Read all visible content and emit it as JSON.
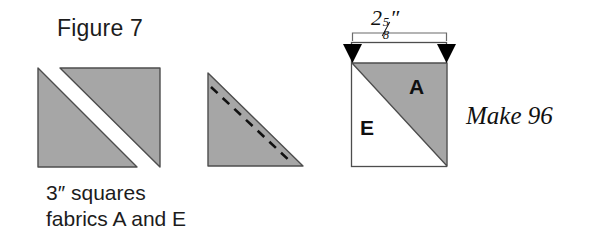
{
  "figure": {
    "title": "Figure 7",
    "make_label": "Make 96",
    "caption_line_1": "3″ squares",
    "caption_line_2": "fabrics A and E"
  },
  "dimension": {
    "whole": "2",
    "numerator": "5",
    "slash": "/",
    "denominator": "8",
    "unit": "″",
    "full_text": "2 5/8″"
  },
  "block": {
    "patch_a_label": "A",
    "patch_e_label": "E"
  },
  "colors": {
    "fabric_gray": "#a6a6a6",
    "fabric_white": "#ffffff",
    "outline": "#4d4d4d",
    "stitch_line": "#111111",
    "arrow": "#000000",
    "text": "#1c1c1c"
  },
  "shapes": {
    "step1_caption": "two cut triangles from 3 inch squares",
    "step2_caption": "triangle with dashed stitching line",
    "step3_caption": "finished half square triangle block"
  }
}
